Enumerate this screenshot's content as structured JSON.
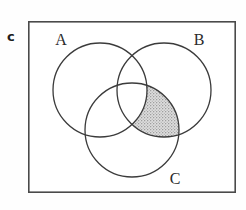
{
  "figure": {
    "panel_label": "c",
    "type": "venn-diagram",
    "background_color": "#fefefe",
    "frame": {
      "x": 28,
      "y": 21,
      "width": 208,
      "height": 172,
      "stroke_color": "#4a4a4a",
      "stroke_width": 1.6,
      "fill_color": "#ffffff"
    },
    "circles": [
      {
        "id": "A",
        "label": "A",
        "cx": 100,
        "cy": 90,
        "r": 47,
        "stroke_color": "#3b3b3b",
        "stroke_width": 1.3,
        "label_x": 61,
        "label_y": 45
      },
      {
        "id": "B",
        "label": "B",
        "cx": 164,
        "cy": 90,
        "r": 47,
        "stroke_color": "#3b3b3b",
        "stroke_width": 1.3,
        "label_x": 199,
        "label_y": 45
      },
      {
        "id": "C",
        "label": "C",
        "cx": 132,
        "cy": 130,
        "r": 47,
        "stroke_color": "#3b3b3b",
        "stroke_width": 1.3,
        "label_x": 175,
        "label_y": 184
      }
    ],
    "shaded_region": {
      "description": "B-and-C-not-A",
      "sets_included": [
        "B",
        "C"
      ],
      "sets_excluded": [
        "A"
      ],
      "fill_color": "#d2d2d2",
      "fill_pattern": "stipple",
      "stroke_color": "#3b3b3b"
    }
  }
}
